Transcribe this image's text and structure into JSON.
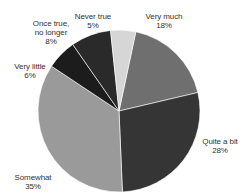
{
  "chart_data": {
    "type": "pie",
    "title": "",
    "categories": [
      "Very much",
      "Quite a bit",
      "Somewhat",
      "Very little",
      "Once true, no longer",
      "Never true"
    ],
    "values": [
      18,
      28,
      35,
      6,
      8,
      5
    ],
    "unit": "%",
    "start_angle_deg": 0,
    "direction": "clockwise",
    "colors": [
      "#6f6f6f",
      "#353535",
      "#9a9a9a",
      "#1c1c1c",
      "#2a2a2a",
      "#d6d6d6"
    ],
    "legend": "none (direct labels)",
    "labels": [
      {
        "name": "Very much",
        "lines": [
          "Very much"
        ],
        "value": "18%",
        "x": 164,
        "y": 12
      },
      {
        "name": "Quite a bit",
        "lines": [
          "Quite a bit"
        ],
        "value": "28%",
        "x": 220,
        "y": 137
      },
      {
        "name": "Somewhat",
        "lines": [
          "Somewhat"
        ],
        "value": "35%",
        "x": 33,
        "y": 173
      },
      {
        "name": "Very little",
        "lines": [
          "Very little"
        ],
        "value": "6%",
        "x": 30,
        "y": 62
      },
      {
        "name": "Once true, no longer",
        "lines": [
          "Once true,",
          "no longer"
        ],
        "value": "8%",
        "x": 51,
        "y": 19
      },
      {
        "name": "Never true",
        "lines": [
          "Never true"
        ],
        "value": "5%",
        "x": 93,
        "y": 12
      }
    ]
  },
  "pie": {
    "cx": 119,
    "cy": 111,
    "r": 81
  }
}
